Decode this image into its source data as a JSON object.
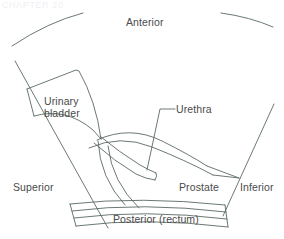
{
  "figure": {
    "header_ghost": "CHAPTER 20",
    "stroke_color": "#5a6a62",
    "label_color": "#4a4a4a",
    "background_color": "#ffffff"
  },
  "labels": {
    "anterior": "Anterior",
    "bladder_line1": "Urinary",
    "bladder_line2": "bladder",
    "urethra": "Urethra",
    "superior": "Superior",
    "prostate": "Prostate",
    "inferior": "Inferior",
    "posterior": "Posterior (rectum)"
  },
  "structures": [
    {
      "name": "urinary-bladder",
      "label": "Urinary bladder"
    },
    {
      "name": "prostate",
      "label": "Prostate"
    },
    {
      "name": "urethra",
      "label": "Urethra"
    },
    {
      "name": "rectum",
      "label": "Posterior (rectum)"
    }
  ],
  "orientation_markers": [
    {
      "name": "anterior",
      "label": "Anterior",
      "position": "top"
    },
    {
      "name": "posterior",
      "label": "Posterior (rectum)",
      "position": "bottom"
    },
    {
      "name": "superior",
      "label": "Superior",
      "position": "left"
    },
    {
      "name": "inferior",
      "label": "Inferior",
      "position": "right"
    }
  ]
}
